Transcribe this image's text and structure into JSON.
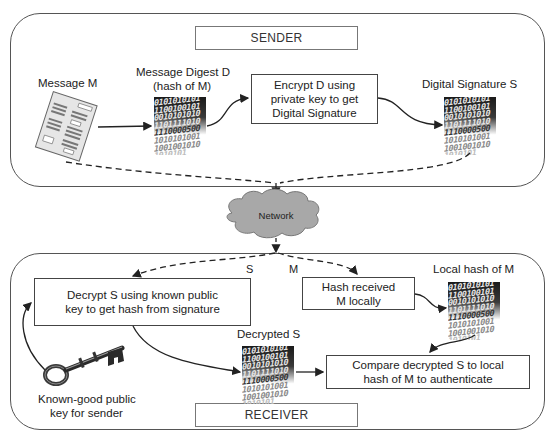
{
  "sender": {
    "panel_label": "SENDER",
    "message_label": "Message M",
    "digest_label_line1": "Message Digest  D",
    "digest_label_line2": "(hash of M)",
    "encrypt_box": "Encrypt D using private key to get Digital Signature",
    "signature_label": "Digital Signature S"
  },
  "network": {
    "label": "Network",
    "edge_label_s": "S",
    "edge_label_m": "M"
  },
  "receiver": {
    "panel_label": "RECEIVER",
    "decrypt_box": "Decrypt S using known public key to get hash from signature",
    "hash_box": "Hash received M locally",
    "local_hash_label": "Local hash of M",
    "decrypted_label": "Decrypted S",
    "compare_box": "Compare decrypted S to local hash of M to authenticate",
    "key_label_line1": "Known-good public",
    "key_label_line2": "key for sender"
  },
  "binary_rows": [
    "0101010101",
    "1100100101",
    "0010101010",
    "1101111010",
    "1110000500",
    "1010101001",
    "1001001010",
    "1010101"
  ],
  "icons": {
    "message": "document-icon",
    "binary": "binary-data-icon",
    "cloud": "cloud-icon",
    "key": "key-icon"
  },
  "colors": {
    "panel_border": "#555555",
    "cloud_fill": "#a8a8a8",
    "line": "#222222"
  }
}
